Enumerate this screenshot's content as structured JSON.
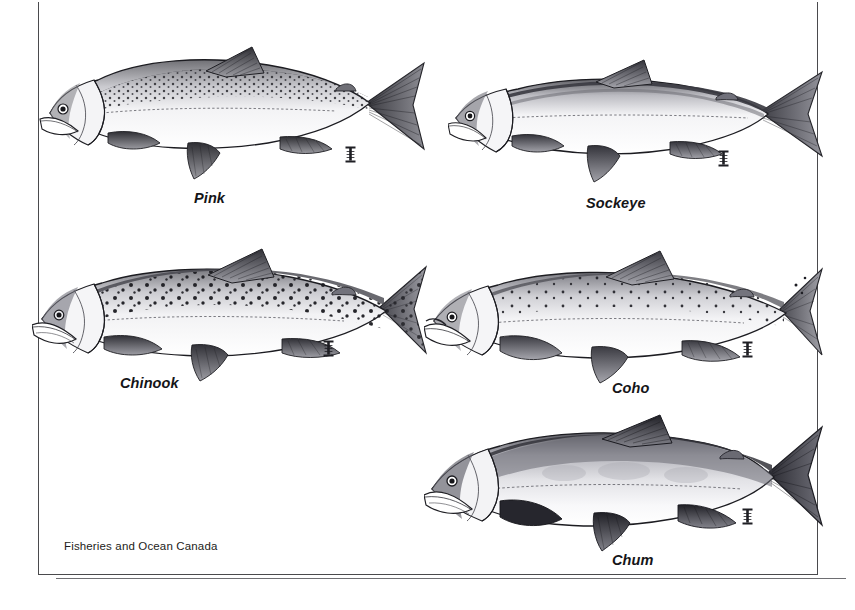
{
  "figure": {
    "credit": "Fisheries and Ocean Canada",
    "background_color": "#ffffff",
    "ink_color": "#1d1d20",
    "frame_color": "#4a4a4d",
    "illustration_style": "pen-and-ink stipple engraving",
    "plates": [
      {
        "id": "pink",
        "label": "Pink",
        "label_x": 194,
        "label_y": 190,
        "art_x": 36,
        "art_y": 33,
        "art_w": 390,
        "art_h": 150,
        "marker_x": 345,
        "marker_y": 146,
        "body_shade": "#e8e8ea",
        "spotting": "heavy-large-oval-spots-back-and-tail",
        "tail": "large-deeply-forked-rayed",
        "notes": "humpback; speckled dorsal surface; pale silver belly"
      },
      {
        "id": "sockeye",
        "label": "Sockeye",
        "label_x": 586,
        "label_y": 195,
        "art_x": 448,
        "art_y": 46,
        "art_w": 382,
        "art_h": 140,
        "marker_x": 718,
        "marker_y": 150,
        "body_shade": "#ececee",
        "spotting": "none",
        "tail": "moderately-forked",
        "notes": "slender streamlined body; unspotted back; fine lateral line"
      },
      {
        "id": "chinook",
        "label": "Chinook",
        "label_x": 120,
        "label_y": 375,
        "art_x": 32,
        "art_y": 243,
        "art_w": 396,
        "art_h": 140,
        "marker_x": 323,
        "marker_y": 340,
        "body_shade": "#e7e7e9",
        "spotting": "distinct-round-black-spots-back-dorsal-and-both-tail-lobes",
        "tail": "broad-spotted-forked",
        "notes": "largest species; dense black spotting; heavy jaw"
      },
      {
        "id": "coho",
        "label": "Coho",
        "label_x": 612,
        "label_y": 380,
        "art_x": 424,
        "art_y": 247,
        "art_w": 400,
        "art_h": 140,
        "marker_x": 742,
        "marker_y": 341,
        "body_shade": "#eaeaec",
        "spotting": "small-spots-back-and-upper-tail-lobe-only",
        "tail": "forked-lightly-spotted",
        "notes": "spotting confined to upper caudal lobe; stout caudal peduncle"
      },
      {
        "id": "chum",
        "label": "Chum",
        "label_x": 612,
        "label_y": 552,
        "art_x": 424,
        "art_y": 413,
        "art_w": 400,
        "art_h": 140,
        "marker_x": 742,
        "marker_y": 508,
        "body_shade": "#dedee1",
        "spotting": "none-mottled-flank-shading",
        "tail": "large-dark-deeply-forked",
        "notes": "deep-bodied; dark dense tail; no distinct spots"
      }
    ]
  }
}
